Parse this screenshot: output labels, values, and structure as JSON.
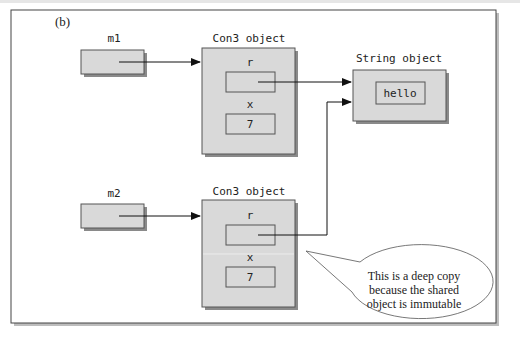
{
  "figure": {
    "panel_label": "(b)",
    "colors": {
      "box_fill": "#d9d9d9",
      "box_stroke": "#555555",
      "shadow": "#8a8a8a",
      "frame_stroke": "#444444",
      "arrow": "#111111"
    }
  },
  "variables": [
    {
      "id": "m1",
      "label": "m1"
    },
    {
      "id": "m2",
      "label": "m2"
    }
  ],
  "objects": [
    {
      "id": "con3-top",
      "title": "Con3 object",
      "fields": [
        {
          "name": "r",
          "value": ""
        },
        {
          "name": "x",
          "value": "7"
        }
      ]
    },
    {
      "id": "con3-bottom",
      "title": "Con3 object",
      "fields": [
        {
          "name": "r",
          "value": ""
        },
        {
          "name": "x",
          "value": "7"
        }
      ]
    },
    {
      "id": "string-object",
      "title": "String object",
      "value": "hello"
    }
  ],
  "references": [
    {
      "from": "m1",
      "to": "con3-top"
    },
    {
      "from": "m2",
      "to": "con3-bottom"
    },
    {
      "from": "con3-top.r",
      "to": "string-object"
    },
    {
      "from": "con3-bottom.r",
      "to": "string-object"
    }
  ],
  "callout": {
    "lines": [
      "This is a deep copy",
      "because the shared",
      "object is immutable"
    ]
  }
}
